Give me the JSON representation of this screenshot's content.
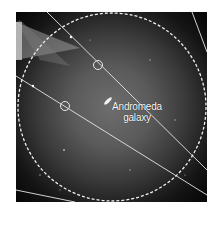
{
  "figure": {
    "label_line1": "Andromeda",
    "label_line2": "galaxy",
    "colors": {
      "background": "#ffffff",
      "sky_center": "#6e6e6e",
      "sky_edge": "#050505",
      "overlay": "#e8e8e8"
    },
    "elements": [
      "dashed-field-circle",
      "satellite-track-lines",
      "circled-object-1",
      "circled-object-2",
      "andromeda-galaxy",
      "light-wedge"
    ]
  }
}
